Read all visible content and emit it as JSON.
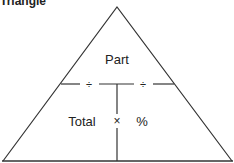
{
  "title": "Triangle",
  "labels": {
    "top": "Part",
    "bottom_left": "Total",
    "bottom_right": "%",
    "divide_left": "÷",
    "divide_right": "÷",
    "multiply": "×"
  }
}
